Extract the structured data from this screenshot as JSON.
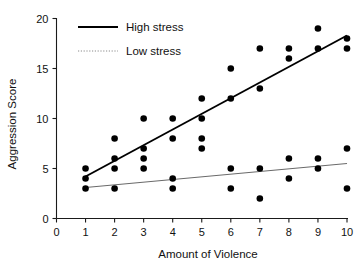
{
  "chart_data": {
    "type": "scatter",
    "title": "",
    "xlabel": "Amount of Violence",
    "ylabel": "Aggression Score",
    "xlim": [
      0,
      10
    ],
    "ylim": [
      0,
      20
    ],
    "xticks": [
      0,
      1,
      2,
      3,
      4,
      5,
      6,
      7,
      8,
      9,
      10
    ],
    "yticks": [
      0,
      5,
      10,
      15,
      20
    ],
    "xtick_labels": [
      "0",
      "1",
      "2",
      "3",
      "4",
      "5",
      "6",
      "7",
      "8",
      "9",
      "10"
    ],
    "ytick_labels": [
      "0",
      "5",
      "10",
      "15",
      "20"
    ],
    "grid": false,
    "legend_position": "top-left",
    "marker": "filled-circle",
    "marker_color": "#000000",
    "series": [
      {
        "name": "High stress",
        "line_style": "solid",
        "line_color": "#000000",
        "points": [
          {
            "x": 1,
            "y": 5
          },
          {
            "x": 1,
            "y": 4
          },
          {
            "x": 2,
            "y": 8
          },
          {
            "x": 2,
            "y": 6
          },
          {
            "x": 2,
            "y": 5
          },
          {
            "x": 3,
            "y": 10
          },
          {
            "x": 3,
            "y": 7
          },
          {
            "x": 3,
            "y": 6
          },
          {
            "x": 3,
            "y": 5
          },
          {
            "x": 4,
            "y": 10
          },
          {
            "x": 4,
            "y": 8
          },
          {
            "x": 5,
            "y": 12
          },
          {
            "x": 5,
            "y": 10
          },
          {
            "x": 5,
            "y": 8
          },
          {
            "x": 5,
            "y": 7
          },
          {
            "x": 6,
            "y": 15
          },
          {
            "x": 6,
            "y": 12
          },
          {
            "x": 7,
            "y": 17
          },
          {
            "x": 7,
            "y": 13
          },
          {
            "x": 8,
            "y": 17
          },
          {
            "x": 8,
            "y": 16
          },
          {
            "x": 9,
            "y": 19
          },
          {
            "x": 9,
            "y": 17
          },
          {
            "x": 10,
            "y": 18
          },
          {
            "x": 10,
            "y": 17
          }
        ],
        "fit_line": {
          "x1": 1,
          "y1": 4.2,
          "x2": 10,
          "y2": 18.3
        }
      },
      {
        "name": "Low stress",
        "line_style": "dotted",
        "line_color": "#6a6a6a",
        "points": [
          {
            "x": 1,
            "y": 3
          },
          {
            "x": 2,
            "y": 3
          },
          {
            "x": 4,
            "y": 4
          },
          {
            "x": 4,
            "y": 3
          },
          {
            "x": 6,
            "y": 5
          },
          {
            "x": 6,
            "y": 3
          },
          {
            "x": 7,
            "y": 5
          },
          {
            "x": 7,
            "y": 2
          },
          {
            "x": 8,
            "y": 6
          },
          {
            "x": 8,
            "y": 4
          },
          {
            "x": 9,
            "y": 6
          },
          {
            "x": 9,
            "y": 5
          },
          {
            "x": 10,
            "y": 7
          },
          {
            "x": 10,
            "y": 3
          }
        ],
        "fit_line": {
          "x1": 1,
          "y1": 3.1,
          "x2": 10,
          "y2": 5.5
        }
      }
    ]
  },
  "legend": {
    "entries": [
      {
        "label": "High stress",
        "style": "solid"
      },
      {
        "label": "Low stress",
        "style": "dotted"
      }
    ]
  },
  "axes": {
    "x_title": "Amount of Violence",
    "y_title": "Aggression Score"
  }
}
